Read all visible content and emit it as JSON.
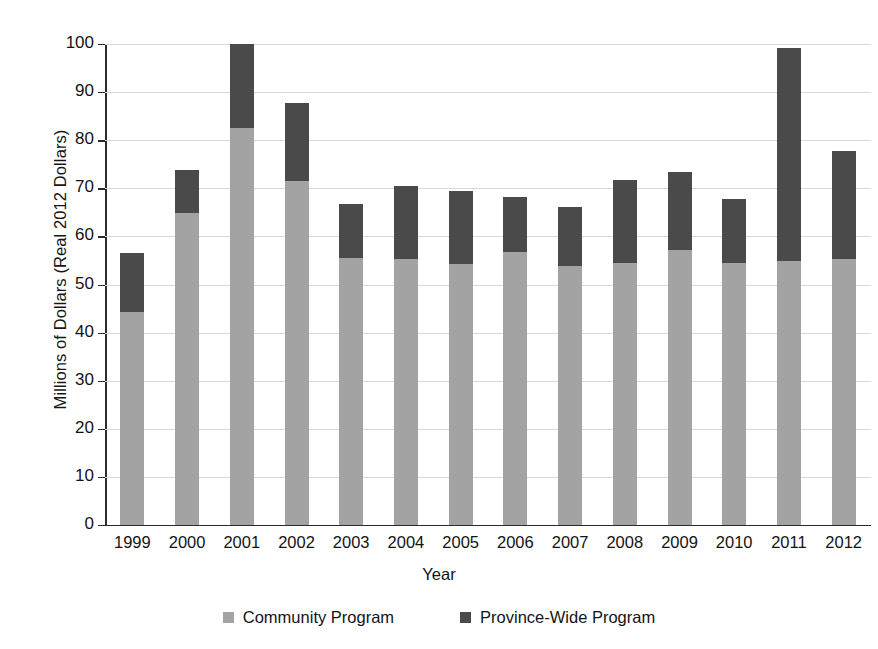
{
  "chart_data": {
    "type": "bar",
    "subtype": "stacked",
    "title": "",
    "xlabel": "Year",
    "ylabel": "Millions of Dollars (Real 2012 Dollars)",
    "ylim": [
      0,
      100
    ],
    "ytick_step": 10,
    "yticks": [
      "0",
      "10",
      "20",
      "30",
      "40",
      "50",
      "60",
      "70",
      "80",
      "90",
      "100"
    ],
    "grid": true,
    "legend_position": "bottom",
    "categories": [
      "1999",
      "2000",
      "2001",
      "2002",
      "2003",
      "2004",
      "2005",
      "2006",
      "2007",
      "2008",
      "2009",
      "2010",
      "2011",
      "2012"
    ],
    "series": [
      {
        "name": "Community Program",
        "color": "#a3a3a3",
        "values": [
          44.3,
          64.8,
          82.5,
          71.5,
          55.6,
          55.4,
          54.3,
          56.7,
          53.8,
          54.4,
          57.2,
          54.4,
          54.8,
          55.4
        ]
      },
      {
        "name": "Province-Wide Program",
        "color": "#4a4a4a",
        "values": [
          12.2,
          9.1,
          17.5,
          16.2,
          11.1,
          15.0,
          15.2,
          11.5,
          12.4,
          17.4,
          16.2,
          13.3,
          44.4,
          22.3
        ]
      }
    ],
    "totals": [
      56.5,
      73.9,
      100.0,
      87.7,
      66.7,
      70.4,
      69.5,
      68.2,
      66.2,
      71.8,
      73.4,
      67.7,
      99.2,
      77.7
    ]
  },
  "legend": {
    "items": [
      {
        "label": "Community Program",
        "color": "#a3a3a3"
      },
      {
        "label": "Province-Wide Program",
        "color": "#4a4a4a"
      }
    ]
  },
  "axes": {
    "x_title": "Year",
    "y_title": "Millions of Dollars (Real 2012 Dollars)"
  }
}
